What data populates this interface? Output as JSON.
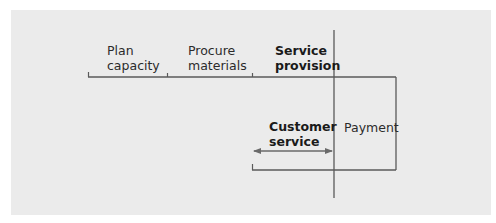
{
  "diagram": {
    "stages": [
      {
        "id": "plan-capacity",
        "label": "Plan\ncapacity",
        "emphasis": false
      },
      {
        "id": "procure-materials",
        "label": "Procure\nmaterials",
        "emphasis": false
      },
      {
        "id": "service-provision",
        "label": "Service\nprovision",
        "emphasis": true
      }
    ],
    "lower_stage": {
      "id": "customer-service",
      "label": "Customer\nservice",
      "emphasis": true
    },
    "side_stage": {
      "id": "payment",
      "label": "Payment",
      "emphasis": false
    },
    "colors": {
      "background": "#ebebeb",
      "line": "#5a5a5a",
      "text": "#2b2b2b"
    }
  }
}
